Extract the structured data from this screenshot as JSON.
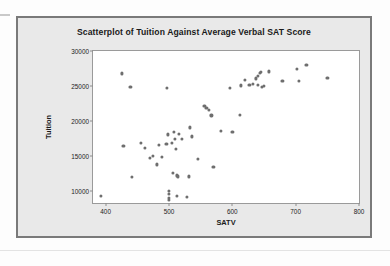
{
  "chart_data": {
    "type": "scatter",
    "title": "Scatterplot of Tuition Against Average Verbal SAT Score",
    "xlabel": "SATV",
    "ylabel": "Tuition",
    "xlim": [
      380,
      800
    ],
    "ylim": [
      8300,
      30000
    ],
    "xticks": [
      400,
      500,
      600,
      700,
      800
    ],
    "yticks": [
      10000,
      15000,
      20000,
      25000,
      30000
    ],
    "xtick_labels": [
      "400",
      "500",
      "600",
      "700",
      "800"
    ],
    "ytick_labels": [
      "10000",
      "15000",
      "20000",
      "25000",
      "30000"
    ],
    "grid": false,
    "legend": null,
    "marker_color": "#6e6e6e",
    "marker_shape": "circle",
    "series": [
      {
        "name": "Colleges",
        "points": [
          [
            392,
            9300
          ],
          [
            425,
            26800
          ],
          [
            428,
            16500
          ],
          [
            439,
            24900
          ],
          [
            441,
            12000
          ],
          [
            455,
            16900
          ],
          [
            462,
            16200
          ],
          [
            470,
            14700
          ],
          [
            474,
            15000
          ],
          [
            481,
            13800
          ],
          [
            484,
            16600
          ],
          [
            489,
            14900
          ],
          [
            497,
            24700
          ],
          [
            496,
            16700
          ],
          [
            498,
            18100
          ],
          [
            500,
            10050
          ],
          [
            500,
            9550
          ],
          [
            500,
            9050
          ],
          [
            500,
            8750
          ],
          [
            505,
            16900
          ],
          [
            506,
            12550
          ],
          [
            508,
            18500
          ],
          [
            509,
            17400
          ],
          [
            511,
            16000
          ],
          [
            512,
            9300
          ],
          [
            513,
            12250
          ],
          [
            514,
            12100
          ],
          [
            515,
            18200
          ],
          [
            521,
            17500
          ],
          [
            528,
            9200
          ],
          [
            531,
            12100
          ],
          [
            533,
            19100
          ],
          [
            536,
            17800
          ],
          [
            545,
            14650
          ],
          [
            556,
            22200
          ],
          [
            559,
            21900
          ],
          [
            563,
            21600
          ],
          [
            567,
            20800
          ],
          [
            570,
            13450
          ],
          [
            582,
            18600
          ],
          [
            596,
            24700
          ],
          [
            600,
            18400
          ],
          [
            612,
            20900
          ],
          [
            614,
            25100
          ],
          [
            620,
            25900
          ],
          [
            627,
            25200
          ],
          [
            633,
            25250
          ],
          [
            637,
            26100
          ],
          [
            640,
            26400
          ],
          [
            641,
            25200
          ],
          [
            644,
            26900
          ],
          [
            645,
            27000
          ],
          [
            647,
            24900
          ],
          [
            650,
            25050
          ],
          [
            658,
            27100
          ],
          [
            679,
            25700
          ],
          [
            702,
            27400
          ],
          [
            705,
            25700
          ],
          [
            717,
            28000
          ],
          [
            750,
            26200
          ]
        ]
      }
    ]
  }
}
